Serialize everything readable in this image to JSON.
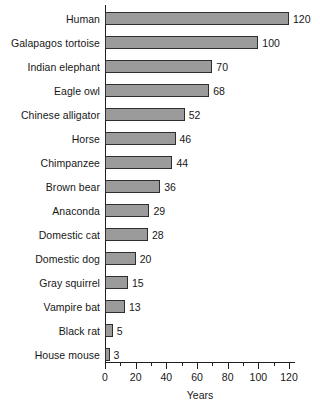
{
  "chart_data": {
    "type": "bar",
    "orientation": "horizontal",
    "title": "",
    "xlabel": "Years",
    "ylabel": "",
    "xlim": [
      0,
      128
    ],
    "xticks": [
      0,
      20,
      40,
      60,
      80,
      100,
      120
    ],
    "xtick_labels": [
      "0",
      "20",
      "40",
      "60",
      "80",
      "100",
      "120"
    ],
    "minor_tick_step": 10,
    "grid": false,
    "legend": false,
    "bar_color": "#9b9b9b",
    "bar_edge_color": "#2e2e2e",
    "axis_color": "#1f1f1f",
    "background_color": "#ffffff",
    "show_value_labels": true,
    "categories": [
      "Human",
      "Galapagos tortoise",
      "Indian elephant",
      "Eagle owl",
      "Chinese alligator",
      "Horse",
      "Chimpanzee",
      "Brown bear",
      "Anaconda",
      "Domestic cat",
      "Domestic dog",
      "Gray squirrel",
      "Vampire bat",
      "Black rat",
      "House mouse"
    ],
    "values": [
      120,
      100,
      70,
      68,
      52,
      46,
      44,
      36,
      29,
      28,
      20,
      15,
      13,
      5,
      3
    ],
    "value_labels": [
      "120",
      "100",
      "70",
      "68",
      "52",
      "46",
      "44",
      "36",
      "29",
      "28",
      "20",
      "15",
      "13",
      "5",
      "3"
    ]
  }
}
